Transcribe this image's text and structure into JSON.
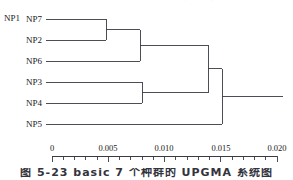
{
  "figure": {
    "heading_cropped": "基于线粒体细胞色素 b 基因序列的遗传距离分析",
    "caption_cropped": "图 5-23   basic 7 个种群的 UPGMA 系统图",
    "stray_label": "NP1",
    "background_color": "#ffffff",
    "line_color": "#3a3a42"
  },
  "axis": {
    "title": "",
    "min": 0,
    "max": 0.02,
    "pixel_min": 52,
    "pixel_max": 277,
    "major_ticks": [
      {
        "value": 0,
        "label": "0",
        "x": 52
      },
      {
        "value": 0.005,
        "label": "0.005",
        "x": 108
      },
      {
        "value": 0.01,
        "label": "0.010",
        "x": 164
      },
      {
        "value": 0.015,
        "label": "0.015",
        "x": 221
      },
      {
        "value": 0.02,
        "label": "0.020",
        "x": 277
      }
    ],
    "minor_tick_step": 0.001,
    "tick_direction": "down"
  },
  "chart_data": {
    "type": "dendrogram",
    "title": "",
    "xlabel": "",
    "ylabel": "",
    "xlim": [
      0,
      0.02
    ],
    "grid": false,
    "legend": "none",
    "method": "UPGMA",
    "leaves": [
      {
        "name": "NP7",
        "y": 19
      },
      {
        "name": "NP2",
        "y": 40
      },
      {
        "name": "NP6",
        "y": 61
      },
      {
        "name": "NP3",
        "y": 82
      },
      {
        "name": "NP4",
        "y": 103
      },
      {
        "name": "NP5",
        "y": 124
      }
    ],
    "merges": [
      {
        "id": "m1",
        "children": [
          "NP7",
          "NP2"
        ],
        "height": 0.0048,
        "x": 106,
        "y": 29.5
      },
      {
        "id": "m2",
        "children": [
          "m1",
          "NP6"
        ],
        "height": 0.0078,
        "x": 140,
        "y": 45.2
      },
      {
        "id": "m3",
        "children": [
          "NP3",
          "NP4"
        ],
        "height": 0.008,
        "x": 142,
        "y": 92.5
      },
      {
        "id": "m4",
        "children": [
          "m2",
          "m3"
        ],
        "height": 0.0139,
        "x": 208,
        "y": 68.9
      },
      {
        "id": "m5",
        "children": [
          "m4",
          "NP5"
        ],
        "height": 0.0151,
        "x": 222,
        "y": 96.5
      }
    ],
    "root_stem": {
      "from_x": 222,
      "to_x": 283,
      "y": 96.5
    }
  }
}
